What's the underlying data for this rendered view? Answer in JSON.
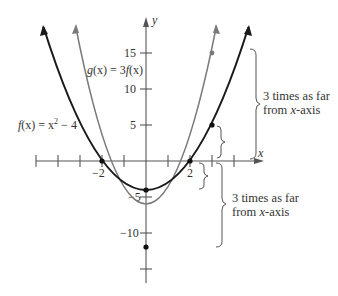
{
  "figure": {
    "axes": {
      "x_label": "x",
      "y_label": "y",
      "x_tick_labels": [
        {
          "value": -2,
          "text": "−2"
        },
        {
          "value": 2,
          "text": "2"
        }
      ],
      "y_tick_labels": [
        {
          "value": 15,
          "text": "15"
        },
        {
          "value": 10,
          "text": "10"
        },
        {
          "value": 5,
          "text": "5"
        },
        {
          "value": -5,
          "text": "−5"
        },
        {
          "value": -10,
          "text": "−10"
        }
      ]
    },
    "functions": {
      "f": {
        "label_pre": "f",
        "label_mid": "(x) = x",
        "label_sup": "2",
        "label_post": " − 4",
        "color": "#1a1a1a"
      },
      "g": {
        "label_g": "g",
        "label_mid": "(x) = 3",
        "label_f": "f",
        "label_post": "(x)",
        "color": "#7a7a7a"
      }
    },
    "annotations": {
      "upper": {
        "line1": "3 times as far",
        "line2_pre": "from ",
        "line2_var": "x",
        "line2_post": "-axis"
      },
      "lower": {
        "line1": "3 times as far",
        "line2_pre": "from ",
        "line2_var": "x",
        "line2_post": "-axis"
      }
    },
    "points": [
      {
        "name": "f(-2)",
        "x": -2,
        "y": 0
      },
      {
        "name": "f(2)",
        "x": 2,
        "y": 0
      },
      {
        "name": "f(0)",
        "x": 0,
        "y": -4
      },
      {
        "name": "g(0)",
        "x": 0,
        "y": -12
      },
      {
        "name": "f(3)",
        "x": 3,
        "y": 5
      },
      {
        "name": "g(3)",
        "x": 3,
        "y": 15
      }
    ]
  }
}
